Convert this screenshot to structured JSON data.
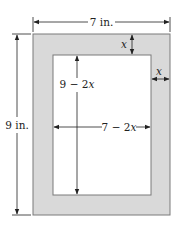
{
  "diagram": {
    "colors": {
      "frame_fill": "#d9d9d9",
      "frame_stroke": "#7a7a7a",
      "inner_fill": "#ffffff",
      "line": "#222222"
    },
    "labels": {
      "width_outer": "7 in.",
      "height_outer": "9 in.",
      "border_top": "x",
      "border_right": "x",
      "height_inner": "9 − 2x",
      "width_inner": "7 − 2x"
    },
    "label_parts": {
      "height_inner_num": "9 − 2",
      "height_inner_var": "x",
      "width_inner_num": "7 − 2",
      "width_inner_var": "x"
    }
  }
}
